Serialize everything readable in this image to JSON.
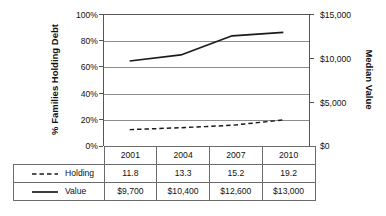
{
  "chart_data": {
    "type": "line",
    "title": "",
    "subtitle": "",
    "xlabel": "",
    "ylabel": "% Families Holding Debt",
    "y2label": "Median Value",
    "categories": [
      "2001",
      "2004",
      "2007",
      "2010"
    ],
    "grid": true,
    "legend_position": "table-bottom",
    "yaxis_left": {
      "label": "% Families Holding Debt",
      "ticks": [
        "0%",
        "20%",
        "40%",
        "60%",
        "80%",
        "100%"
      ],
      "tick_values": [
        0,
        20,
        40,
        60,
        80,
        100
      ],
      "ylim": [
        0,
        100
      ]
    },
    "yaxis_right": {
      "label": "Median Value",
      "ticks": [
        "$0",
        "$5,000",
        "$10,000",
        "$15,000"
      ],
      "tick_values": [
        0,
        5000,
        10000,
        15000
      ],
      "ylim": [
        0,
        15000
      ]
    },
    "series": [
      {
        "name": "Holding",
        "style": "dashed",
        "axis": "left",
        "color": "#1a1a1a",
        "values": [
          11.8,
          13.3,
          15.2,
          19.2
        ],
        "display_values": [
          "11.8",
          "13.3",
          "15.2",
          "19.2"
        ]
      },
      {
        "name": "Value",
        "style": "solid",
        "axis": "right",
        "color": "#1a1a1a",
        "values": [
          9700,
          10400,
          12600,
          13000
        ],
        "display_values": [
          "$9,700",
          "$10,400",
          "$12,600",
          "$13,000"
        ]
      }
    ]
  },
  "table": {
    "header": [
      "",
      "2001",
      "2004",
      "2007",
      "2010"
    ],
    "rows": [
      {
        "legend_icon": "dashed-line-icon",
        "label": "Holding",
        "cells": [
          "11.8",
          "13.3",
          "15.2",
          "19.2"
        ]
      },
      {
        "legend_icon": "solid-line-icon",
        "label": "Value",
        "cells": [
          "$9,700",
          "$10,400",
          "$12,600",
          "$13,000"
        ]
      }
    ]
  },
  "colors": {
    "line": "#1a1a1a",
    "grid": "#8c8c8c",
    "axis": "#555555",
    "table_border": "#6b6b6b",
    "text": "#111111",
    "background": "#ffffff"
  }
}
